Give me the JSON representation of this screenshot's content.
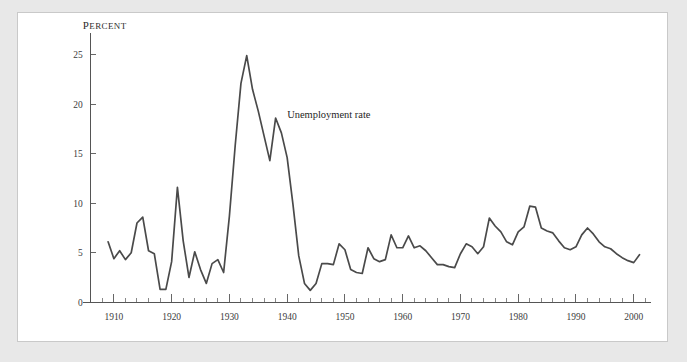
{
  "figure": {
    "background_color": "#e8e8e8",
    "panel_color": "#ffffff",
    "panel_border_color": "#c9c9c9",
    "ink_color": "#4a4a4a"
  },
  "chart_data": {
    "type": "line",
    "title": "",
    "subtitle": "",
    "xlabel": "",
    "ylabel": "Percent",
    "ylabel_display": "PERCENT",
    "xlim": [
      1906,
      2003
    ],
    "ylim": [
      0,
      27
    ],
    "grid": false,
    "legend": "none",
    "y_ticks": [
      0,
      5,
      10,
      15,
      20,
      25
    ],
    "y_tick_labels": [
      "0",
      "5",
      "10",
      "15",
      "20",
      "25"
    ],
    "x_ticks": [
      1910,
      1920,
      1930,
      1940,
      1950,
      1960,
      1970,
      1980,
      1990,
      2000
    ],
    "x_tick_labels": [
      "1910",
      "1920",
      "1930",
      "1940",
      "1950",
      "1960",
      "1970",
      "1980",
      "1990",
      "2000"
    ],
    "x_minor_tick_step": 2,
    "annotations": [
      {
        "text": "Unemployment rate",
        "x": 1940,
        "y": 18.6,
        "anchor": "start"
      }
    ],
    "series": [
      {
        "name": "Unemployment rate",
        "color": "#4a4a4a",
        "x": [
          1909,
          1910,
          1911,
          1912,
          1913,
          1914,
          1915,
          1916,
          1917,
          1918,
          1919,
          1920,
          1921,
          1922,
          1923,
          1924,
          1925,
          1926,
          1927,
          1928,
          1929,
          1930,
          1931,
          1932,
          1933,
          1934,
          1935,
          1936,
          1937,
          1938,
          1939,
          1940,
          1941,
          1942,
          1943,
          1944,
          1945,
          1946,
          1947,
          1948,
          1949,
          1950,
          1951,
          1952,
          1953,
          1954,
          1955,
          1956,
          1957,
          1958,
          1959,
          1960,
          1961,
          1962,
          1963,
          1964,
          1965,
          1966,
          1967,
          1968,
          1969,
          1970,
          1971,
          1972,
          1973,
          1974,
          1975,
          1976,
          1977,
          1978,
          1979,
          1980,
          1981,
          1982,
          1983,
          1984,
          1985,
          1986,
          1987,
          1988,
          1989,
          1990,
          1991,
          1992,
          1993,
          1994,
          1995,
          1996,
          1997,
          1998,
          1999,
          2000,
          2001
        ],
        "values": [
          6.1,
          4.4,
          5.2,
          4.3,
          5.0,
          8.0,
          8.6,
          5.2,
          4.9,
          1.3,
          1.3,
          4.1,
          11.6,
          6.2,
          2.5,
          5.1,
          3.3,
          1.9,
          3.9,
          4.3,
          3.0,
          8.7,
          15.8,
          22.1,
          24.9,
          21.5,
          19.3,
          16.8,
          14.3,
          18.6,
          17.1,
          14.6,
          9.9,
          4.7,
          1.9,
          1.2,
          1.9,
          3.9,
          3.9,
          3.8,
          5.9,
          5.3,
          3.3,
          3.0,
          2.9,
          5.5,
          4.4,
          4.1,
          4.3,
          6.8,
          5.5,
          5.5,
          6.7,
          5.5,
          5.7,
          5.2,
          4.5,
          3.8,
          3.8,
          3.6,
          3.5,
          4.9,
          5.9,
          5.6,
          4.9,
          5.6,
          8.5,
          7.7,
          7.1,
          6.1,
          5.8,
          7.1,
          7.6,
          9.7,
          9.6,
          7.5,
          7.2,
          7.0,
          6.2,
          5.5,
          5.3,
          5.6,
          6.8,
          7.5,
          6.9,
          6.1,
          5.6,
          5.4,
          4.9,
          4.5,
          4.2,
          4.0,
          4.8
        ]
      }
    ]
  }
}
